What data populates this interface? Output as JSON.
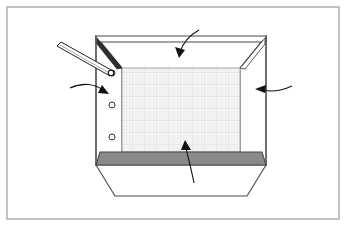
{
  "figure": {
    "title": "Collapsible container assembly — perspective view",
    "canvas": {
      "width": 346,
      "height": 226,
      "background": "#ffffff"
    },
    "border": {
      "name": "figure-border",
      "x": 7,
      "y": 7,
      "width": 332,
      "height": 212,
      "stroke": "#9a9a9a",
      "stroke_width": 1.2,
      "fill": "none"
    },
    "colors": {
      "outline": "#3b3b3b",
      "outline_light": "#6f6f6f",
      "mesh_fill": "#f3f3f3",
      "mesh_line": "#dcdcdc",
      "panel_fill": "#ffffff",
      "bottom_band": "#8a8a8a",
      "bottom_band_stroke": "#4a4a4a",
      "gusset_dark": "#2e2e2e",
      "arrow": "#111111",
      "rod_fill": "#ffffff",
      "rod_stroke": "#222222"
    },
    "parts": [
      {
        "id": "top-rail",
        "name": "top-rail",
        "label": "Upper rim / top rail",
        "points": "96,36 266,36 266,42 96,42"
      },
      {
        "id": "left-panel",
        "name": "left-side-panel",
        "label": "Left side panel with hinge knuckle holes",
        "points": "96,36 122,68 122,152 96,165"
      },
      {
        "id": "right-panel",
        "name": "right-side-panel",
        "label": "Right side panel",
        "points": "266,36 240,68 240,152 266,165"
      },
      {
        "id": "mesh-panel",
        "name": "mesh-back-panel",
        "label": "Mesh / perforated back panel",
        "points": "122,68 240,68 240,152 122,152"
      },
      {
        "id": "bottom-band",
        "name": "bottom-edge-band",
        "label": "Bottom edge band / base flange",
        "points": "100,152 262,152 266,165 96,165"
      },
      {
        "id": "bottom-apron",
        "name": "bottom-apron",
        "label": "Lower skirt / apron",
        "points": "96,165 266,165 247,196 115,196"
      },
      {
        "id": "gusset-left",
        "name": "corner-gusset-left",
        "label": "Left upper corner gusset",
        "points": "97,38 122,68 117,69 97,44"
      },
      {
        "id": "gusset-right",
        "name": "corner-gusset-right",
        "label": "Right upper corner gusset",
        "points": "265,38 240,68 245,69 265,44"
      }
    ],
    "holes": [
      {
        "name": "hinge-hole-1",
        "cx": 112,
        "cy": 73,
        "r": 3.0,
        "label": "Upper hinge knuckle hole"
      },
      {
        "name": "hinge-hole-2",
        "cx": 112,
        "cy": 105,
        "r": 3.0,
        "label": "Middle hinge knuckle hole"
      },
      {
        "name": "hinge-hole-3",
        "cx": 112,
        "cy": 137,
        "r": 3.0,
        "label": "Lower hinge knuckle hole"
      }
    ],
    "pin": {
      "name": "hinge-pin",
      "label": "Hinge pin / rod being inserted",
      "body_points": "58,46 62,43 112,71 110,75",
      "tip": {
        "cx": 111,
        "cy": 73,
        "r": 2.6
      },
      "head_points": "58,46 62,43 66,45 62,49"
    },
    "arrows": [
      {
        "name": "arrow-top-panel",
        "label": "Leader arrow to top rail / back panel",
        "path": "M 199 30 C 190 35 183 43 180 52",
        "head": "180,57 176,48 185,50"
      },
      {
        "name": "arrow-left-panel",
        "label": "Leader arrow to left side panel",
        "path": "M 72 88 C 85 83 96 85 104 91",
        "head": "108,94 99,93 102,86"
      },
      {
        "name": "arrow-right-panel",
        "label": "Leader arrow to right side panel",
        "path": "M 289 86 C 279 91 270 92 262 90",
        "head": "256,89 265,85 265,93"
      },
      {
        "name": "arrow-bottom-panel",
        "label": "Leader arrow to bottom band / mesh panel",
        "path": "M 194 181 C 191 167 188 157 186 147",
        "head": "185,141 191,148 182,150"
      }
    ]
  }
}
